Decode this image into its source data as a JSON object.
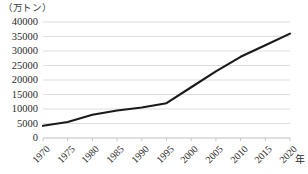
{
  "chart_data": {
    "type": "line",
    "title": "",
    "subtitle": "",
    "unit_label": "（万トン）",
    "xlabel": "年",
    "ylabel": "",
    "categories": [
      "1970",
      "1975",
      "1980",
      "1985",
      "1990",
      "1995",
      "2000",
      "2005",
      "2010",
      "2015",
      "2020"
    ],
    "x": [
      1970,
      1975,
      1980,
      1985,
      1990,
      1995,
      2000,
      2005,
      2010,
      2015,
      2020
    ],
    "values": [
      4200,
      5500,
      8000,
      9500,
      10500,
      12000,
      17500,
      23000,
      28000,
      32000,
      36000
    ],
    "series": [
      {
        "name": "",
        "values": [
          4200,
          5500,
          8000,
          9500,
          10500,
          12000,
          17500,
          23000,
          28000,
          32000,
          36000
        ]
      }
    ],
    "ylim": [
      0,
      40000
    ],
    "xlim": [
      1970,
      2020
    ],
    "ytick_labels": [
      "40000",
      "35000",
      "30000",
      "25000",
      "20000",
      "15000",
      "10000",
      "5000",
      "0"
    ],
    "ytick_values": [
      40000,
      35000,
      30000,
      25000,
      20000,
      15000,
      10000,
      5000,
      0
    ],
    "ytick_step": 5000,
    "grid": true,
    "grid_axis": "y",
    "legend": false,
    "legend_position": "none",
    "line_color": "#1a1a1a",
    "grid_color": "#d9d9d9",
    "axis_color": "#bfbfbf",
    "background_color": "#ffffff",
    "annotations": []
  }
}
